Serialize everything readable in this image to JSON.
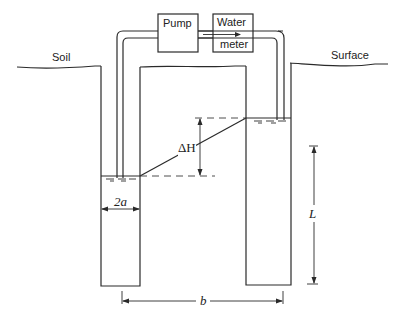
{
  "diagram": {
    "labels": {
      "soil": "Soil",
      "surface": "Surface",
      "pump": "Pump",
      "water_meter_line1": "Water",
      "water_meter_line2": "meter",
      "delta_h": "ΔH",
      "radius": "2a",
      "length": "L",
      "spacing": "b"
    },
    "colors": {
      "line": "#2a2a2a",
      "background": "#ffffff"
    }
  }
}
